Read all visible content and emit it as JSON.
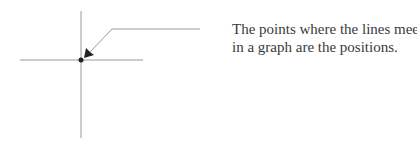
{
  "caption": {
    "lines": [
      "The points where the lines meet",
      "in a graph are the positions."
    ]
  },
  "diagram": {
    "colors": {
      "axis": "#9a9a9a",
      "leader": "#9a9a9a",
      "point": "#222222",
      "arrowhead": "#222222",
      "text": "#3a3a3a"
    },
    "vertical_axis": {
      "x": 81,
      "y1": 11,
      "y2": 138
    },
    "horizontal_axis": {
      "y": 60,
      "x1": 20,
      "x2": 143
    },
    "intersection_point": {
      "x": 81,
      "y": 60,
      "r": 2.5
    },
    "leader_line": {
      "points": [
        [
          200,
          29
        ],
        [
          112,
          29
        ],
        [
          86,
          56
        ]
      ]
    }
  }
}
